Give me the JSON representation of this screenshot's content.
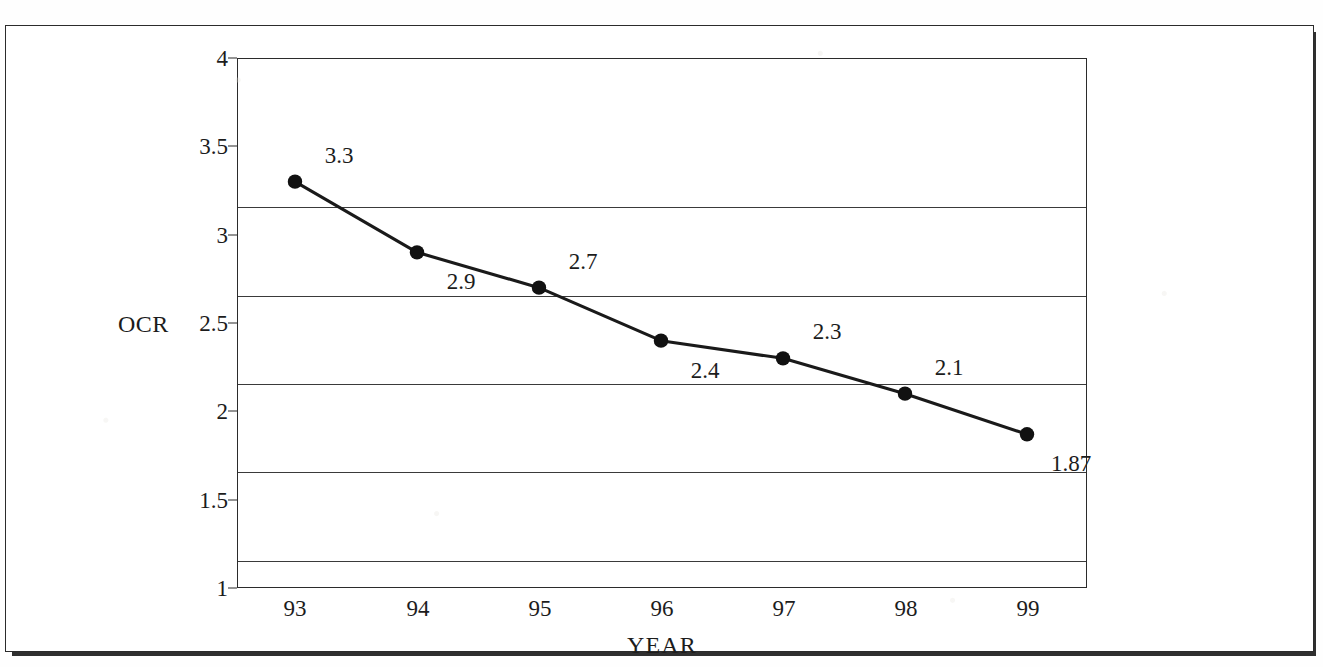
{
  "figure": {
    "background_color": "#ffffff",
    "frame_color": "#2b2b2b",
    "line_color": "#1a1a1a",
    "marker_color": "#111111",
    "grid_color": "#3a3a3a",
    "text_color": "#1c1c1c"
  },
  "chart_data": {
    "type": "line",
    "title": "",
    "subtitle": "",
    "xlabel": "YEAR",
    "ylabel": "OCR",
    "categories": [
      "93",
      "94",
      "95",
      "96",
      "97",
      "98",
      "99"
    ],
    "values": [
      3.3,
      2.9,
      2.7,
      2.4,
      2.3,
      2.1,
      1.87
    ],
    "data_labels": [
      "3.3",
      "2.9",
      "2.7",
      "2.4",
      "2.3",
      "2.1",
      "1.87"
    ],
    "label_positions": [
      "above-right",
      "below-right",
      "above-right",
      "below-right",
      "above-right",
      "above-right",
      "below-right"
    ],
    "series": [
      {
        "name": "OCR",
        "values": [
          3.3,
          2.9,
          2.7,
          2.4,
          2.3,
          2.1,
          1.87
        ]
      }
    ],
    "ylim": [
      1,
      4
    ],
    "yticks": [
      1,
      1.5,
      2,
      2.5,
      3,
      3.5,
      4
    ],
    "ytick_labels": [
      "1",
      "1.5",
      "2",
      "2.5",
      "3",
      "3.5",
      "4"
    ],
    "xtick_labels": [
      "93",
      "94",
      "95",
      "96",
      "97",
      "98",
      "99"
    ],
    "grid": "horizontal",
    "gridlines_at": [
      1.5,
      2,
      2.5,
      3,
      3.5
    ],
    "legend": "none",
    "marker": "filled-circle",
    "annotations": []
  },
  "axes": {
    "y_title": "OCR",
    "x_title": "YEAR",
    "y_tick_0": "1",
    "y_tick_1": "1.5",
    "y_tick_2": "2",
    "y_tick_3": "2.5",
    "y_tick_4": "3",
    "y_tick_5": "3.5",
    "y_tick_6": "4",
    "x_tick_0": "93",
    "x_tick_1": "94",
    "x_tick_2": "95",
    "x_tick_3": "96",
    "x_tick_4": "97",
    "x_tick_5": "98",
    "x_tick_6": "99"
  },
  "point_labels": {
    "p0": "3.3",
    "p1": "2.9",
    "p2": "2.7",
    "p3": "2.4",
    "p4": "2.3",
    "p5": "2.1",
    "p6": "1.87"
  }
}
